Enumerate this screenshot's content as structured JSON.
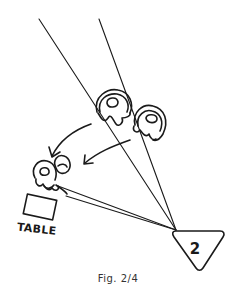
{
  "figure": {
    "caption": "Fig. 2/4",
    "table_label": "TABLE",
    "marker_number": "2",
    "colors": {
      "ink": "#1a1a1a",
      "background": "#ffffff",
      "caption": "#333333"
    }
  },
  "elements": {
    "sight_lines": [
      {
        "from": [
          39,
          19
        ],
        "to": [
          176,
          230
        ]
      },
      {
        "from": [
          99,
          19
        ],
        "to": [
          176,
          230
        ]
      },
      {
        "from": [
          60,
          190
        ],
        "to": [
          176,
          230
        ]
      },
      {
        "from": [
          66,
          200
        ],
        "to": [
          176,
          230
        ]
      }
    ],
    "figures": [
      {
        "name": "upper-left-figure",
        "position": "top"
      },
      {
        "name": "upper-right-figure",
        "position": "top"
      },
      {
        "name": "lower-figures-at-table",
        "position": "bottom-left"
      }
    ],
    "arrows": [
      {
        "name": "curved-arrow-left",
        "direction": "down-left"
      },
      {
        "name": "arrow-right",
        "direction": "down-left"
      }
    ],
    "marker": {
      "shape": "triangle",
      "label": "2"
    }
  }
}
